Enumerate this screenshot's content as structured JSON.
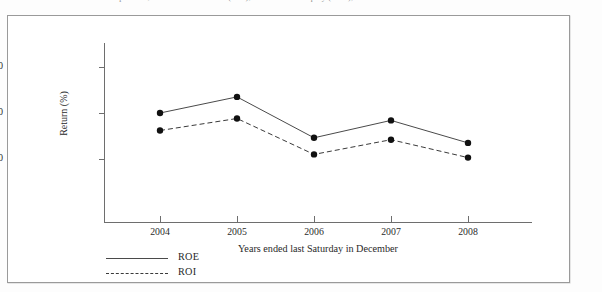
{
  "caption": {
    "text": "Inter Corporation, Return on Investment (ROI), and Return on Equity (ROE), 2004-2008"
  },
  "legend": {
    "items": [
      {
        "label": "ROE",
        "style": "solid",
        "color": "#4a4a4a"
      },
      {
        "label": "ROI",
        "style": "dashed",
        "color": "#3a3a3a"
      }
    ]
  },
  "axis": {
    "y_ticks": [
      "10",
      "20",
      "30"
    ],
    "x_ticks": [
      "2004",
      "2005",
      "2006",
      "2007",
      "2008"
    ],
    "y_title": "Return (%)",
    "x_title": "Years ended last Saturday in December"
  },
  "chart_data": {
    "type": "line",
    "title": "Inter Corporation, Return on Investment (ROI), and Return on Equity (ROE), 2004-2008",
    "categories": [
      "2004",
      "2005",
      "2006",
      "2007",
      "2008"
    ],
    "series": [
      {
        "name": "ROE",
        "style": "solid",
        "values": [
          20.0,
          23.5,
          14.6,
          18.4,
          13.5
        ]
      },
      {
        "name": "ROI",
        "style": "dashed",
        "values": [
          16.2,
          18.8,
          11.0,
          14.2,
          10.3
        ]
      }
    ],
    "xlabel": "Years ended last Saturday in December",
    "ylabel": "Return (%)",
    "ylim": [
      0,
      33
    ],
    "yticks": [
      10,
      20,
      30
    ],
    "grid": false,
    "legend_position": "bottom-left",
    "marker": "filled-circle"
  }
}
